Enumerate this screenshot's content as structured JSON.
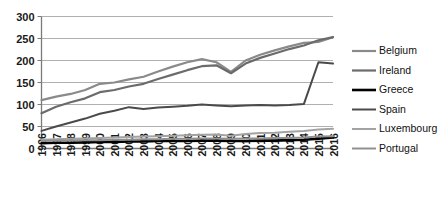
{
  "chart_data": {
    "type": "line",
    "title": "",
    "xlabel": "",
    "ylabel": "",
    "ylim": [
      0,
      300
    ],
    "yticks": [
      0,
      50,
      100,
      150,
      200,
      250,
      300
    ],
    "grid": true,
    "legend_position": "right",
    "categories": [
      "1996",
      "1997",
      "1998",
      "1999",
      "2000",
      "2001",
      "2002",
      "2003",
      "2004",
      "2005",
      "2006",
      "2007",
      "2008",
      "2009",
      "2010",
      "2011",
      "2012",
      "2013",
      "2014",
      "2015",
      "2016"
    ],
    "series": [
      {
        "name": "Belgium",
        "color": "#8a8a8a",
        "width": 2.2,
        "values": [
          110,
          118,
          124,
          133,
          147,
          150,
          157,
          163,
          175,
          186,
          196,
          203,
          196,
          174,
          200,
          213,
          223,
          232,
          240,
          242,
          253
        ]
      },
      {
        "name": "Ireland",
        "color": "#6b6b6b",
        "width": 2.2,
        "values": [
          80,
          95,
          105,
          114,
          128,
          133,
          141,
          147,
          158,
          168,
          178,
          187,
          189,
          171,
          193,
          206,
          216,
          226,
          234,
          246,
          253
        ]
      },
      {
        "name": "Greece",
        "color": "#000000",
        "width": 2.6,
        "values": [
          12,
          13,
          13,
          14,
          15,
          15,
          16,
          16,
          17,
          17,
          17,
          18,
          18,
          17,
          17,
          18,
          18,
          19,
          20,
          22,
          25
        ]
      },
      {
        "name": "Spain",
        "color": "#4a4a4a",
        "width": 2.0,
        "values": [
          40,
          50,
          59,
          68,
          79,
          86,
          94,
          90,
          93,
          95,
          97,
          100,
          98,
          96,
          98,
          99,
          98,
          99,
          101,
          196,
          193
        ]
      },
      {
        "name": "Luxembourg",
        "color": "#a3a3a3",
        "width": 2.0,
        "values": [
          20,
          21,
          22,
          23,
          24,
          25,
          26,
          27,
          28,
          29,
          30,
          31,
          32,
          29,
          33,
          35,
          36,
          38,
          40,
          43,
          45
        ]
      },
      {
        "name": "Portugal",
        "color": "#909090",
        "width": 2.0,
        "values": [
          17,
          18,
          18,
          19,
          19,
          20,
          20,
          21,
          21,
          22,
          22,
          23,
          23,
          22,
          23,
          23,
          24,
          24,
          25,
          27,
          28
        ]
      }
    ]
  },
  "legend": {
    "items": [
      {
        "label": "Belgium"
      },
      {
        "label": "Ireland"
      },
      {
        "label": "Greece"
      },
      {
        "label": "Spain"
      },
      {
        "label": "Luxembourg"
      },
      {
        "label": "Portugal"
      }
    ]
  }
}
